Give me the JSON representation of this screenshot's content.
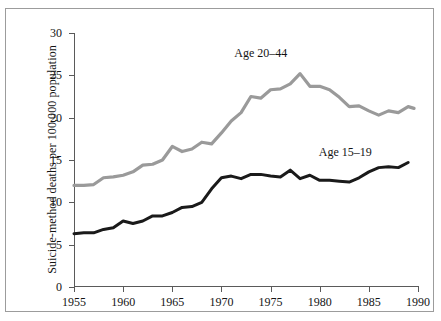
{
  "chart_data": {
    "type": "line",
    "title": "",
    "xlabel": "",
    "ylabel": "Suicide-method deaths per 100,000 population",
    "xlim": [
      1955,
      1990
    ],
    "ylim": [
      0,
      30
    ],
    "xticks": [
      1955,
      1960,
      1965,
      1970,
      1975,
      1980,
      1985,
      1990
    ],
    "yticks": [
      0,
      5,
      10,
      15,
      20,
      25,
      30
    ],
    "grid": false,
    "legend_position": "inline-annotations",
    "x": [
      1955,
      1956,
      1957,
      1958,
      1959,
      1960,
      1961,
      1962,
      1963,
      1964,
      1965,
      1966,
      1967,
      1968,
      1969,
      1970,
      1971,
      1972,
      1973,
      1974,
      1975,
      1976,
      1977,
      1978,
      1979,
      1980,
      1981,
      1982,
      1983,
      1984,
      1985,
      1986,
      1987,
      1988,
      1989
    ],
    "series": [
      {
        "name": "Age 20–44",
        "color": "#9a9a9a",
        "values": [
          12.0,
          12.0,
          12.1,
          12.9,
          13.0,
          13.2,
          13.6,
          14.4,
          14.5,
          15.0,
          16.6,
          16.0,
          16.3,
          17.1,
          16.9,
          18.2,
          19.6,
          20.6,
          22.5,
          22.3,
          23.3,
          23.4,
          24.0,
          25.2,
          23.7,
          23.7,
          23.3,
          22.4,
          21.3,
          21.4,
          20.8,
          20.3,
          20.8,
          20.6,
          21.3
        ],
        "last_value": 21.1
      },
      {
        "name": "Age 15–19",
        "color": "#1a1a1a",
        "values": [
          6.3,
          6.4,
          6.4,
          6.8,
          7.0,
          7.8,
          7.5,
          7.8,
          8.4,
          8.4,
          8.8,
          9.4,
          9.5,
          10.0,
          11.6,
          12.9,
          13.1,
          12.8,
          13.3,
          13.3,
          13.1,
          13.0,
          13.8,
          12.8,
          13.2,
          12.6,
          12.6,
          12.5,
          12.4,
          12.9,
          13.6,
          14.1,
          14.2,
          14.1,
          14.7
        ]
      }
    ],
    "annotations": [
      {
        "text": "Age 20–44",
        "x": 1974.0,
        "y": 27.6
      },
      {
        "text": "Age 15–19",
        "x": 1982.6,
        "y": 16.0
      }
    ]
  }
}
